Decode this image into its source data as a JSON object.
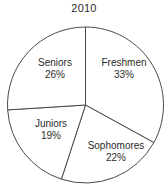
{
  "chart_data": {
    "type": "pie",
    "title": "2010",
    "xlabel": "",
    "ylabel": "",
    "legend_position": "none",
    "grid": false,
    "labels_inside_slices": true,
    "start_angle_deg": 0,
    "direction": "clockwise",
    "categories": [
      "Freshmen",
      "Sophomores",
      "Juniors",
      "Seniors"
    ],
    "values": [
      33,
      22,
      19,
      26
    ],
    "value_unit": "%",
    "slices": [
      {
        "label": "Freshmen",
        "value": 33,
        "value_text": "33%",
        "color": "#ffffff"
      },
      {
        "label": "Sophomores",
        "value": 22,
        "value_text": "22%",
        "color": "#ffffff"
      },
      {
        "label": "Juniors",
        "value": 19,
        "value_text": "19%",
        "color": "#ffffff"
      },
      {
        "label": "Seniors",
        "value": 26,
        "value_text": "26%",
        "color": "#ffffff"
      }
    ]
  },
  "title": "2010",
  "slice_labels": {
    "freshmen_name": "Freshmen",
    "freshmen_pct": "33%",
    "sophomores_name": "Sophomores",
    "sophomores_pct": "22%",
    "juniors_name": "Juniors",
    "juniors_pct": "19%",
    "seniors_name": "Seniors",
    "seniors_pct": "26%"
  },
  "style": {
    "stroke_color": "#4a4a4a",
    "fill_color": "#ffffff",
    "text_color": "#2b2b2b",
    "background_color": "#ffffff"
  }
}
